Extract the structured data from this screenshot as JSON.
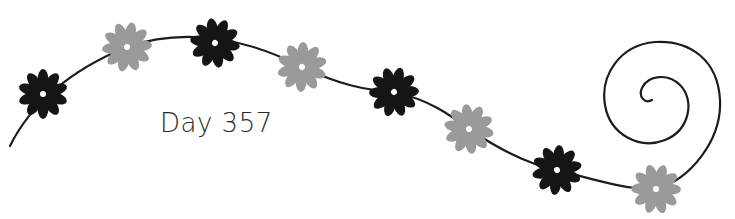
{
  "caption": {
    "text": "Day 357"
  },
  "colors": {
    "dark": "#151515",
    "light": "#9a9a9a",
    "vine": "#1c1c1c",
    "center": "#ffffff"
  },
  "flowers": [
    {
      "cx": 43,
      "cy": 94,
      "tone": "dark"
    },
    {
      "cx": 127,
      "cy": 47,
      "tone": "light"
    },
    {
      "cx": 215,
      "cy": 43,
      "tone": "dark"
    },
    {
      "cx": 302,
      "cy": 67,
      "tone": "light"
    },
    {
      "cx": 394,
      "cy": 92,
      "tone": "dark"
    },
    {
      "cx": 469,
      "cy": 129,
      "tone": "light"
    },
    {
      "cx": 557,
      "cy": 170,
      "tone": "dark"
    },
    {
      "cx": 656,
      "cy": 189,
      "tone": "light"
    }
  ]
}
